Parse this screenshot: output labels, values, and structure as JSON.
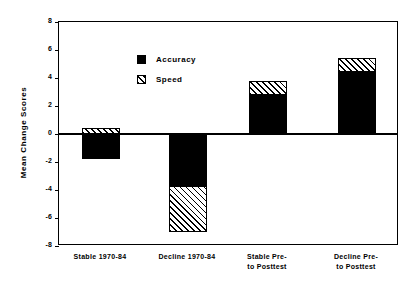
{
  "chart_data": {
    "type": "bar",
    "title": "",
    "subtitle": "",
    "xlabel": "",
    "ylabel": "Mean Change Scores",
    "ylim": [
      -8,
      8
    ],
    "yticks": [
      "8",
      "6",
      "4",
      "2",
      "0",
      "-2",
      "-4",
      "-6",
      "-8"
    ],
    "ytick_values": [
      8,
      6,
      4,
      2,
      0,
      -2,
      -4,
      -6,
      -8
    ],
    "grid": false,
    "stacked": true,
    "legend_position": "upper-left-inside",
    "categories": [
      "Stable  1970-84",
      "Decline  1970-84",
      "Stable  Pre-\nto Posttest",
      "Decline  Pre-\nto Posttest"
    ],
    "series": [
      {
        "name": "Accuracy",
        "values": [
          -1.8,
          -3.7,
          2.8,
          4.4
        ]
      },
      {
        "name": "Speed",
        "values": [
          0.4,
          -3.3,
          1.0,
          1.0
        ]
      }
    ],
    "segments": [
      {
        "category_index": 0,
        "accuracy_from": 0,
        "accuracy_to": -1.8,
        "speed_from": 0,
        "speed_to": 0.4
      },
      {
        "category_index": 1,
        "accuracy_from": 0,
        "accuracy_to": -3.7,
        "speed_from": -3.7,
        "speed_to": -7.0
      },
      {
        "category_index": 2,
        "accuracy_from": 0,
        "accuracy_to": 2.8,
        "speed_from": 2.8,
        "speed_to": 3.8
      },
      {
        "category_index": 3,
        "accuracy_from": 0,
        "accuracy_to": 4.4,
        "speed_from": 4.4,
        "speed_to": 5.4
      }
    ],
    "totals": [
      -1.4,
      -7.0,
      3.8,
      5.4
    ]
  },
  "axis": {
    "y_title": "Mean Change Scores",
    "ticks": [
      {
        "label": "8"
      },
      {
        "label": "6"
      },
      {
        "label": "4"
      },
      {
        "label": "2"
      },
      {
        "label": "0"
      },
      {
        "label": "-2"
      },
      {
        "label": "-4"
      },
      {
        "label": "-6"
      },
      {
        "label": "-8"
      }
    ]
  },
  "legend": {
    "items": [
      {
        "label": "Accuracy",
        "swatch": "solid-black"
      },
      {
        "label": "Speed",
        "swatch": "hatched-diagonal"
      }
    ]
  },
  "x_labels": [
    {
      "line1": "Stable  1970-84",
      "line2": ""
    },
    {
      "line1": "Decline  1970-84",
      "line2": ""
    },
    {
      "line1": "Stable  Pre-",
      "line2": "to Posttest"
    },
    {
      "line1": "Decline  Pre-",
      "line2": "to Posttest"
    }
  ],
  "colors": {
    "accuracy": "#000000",
    "speed_background": "#ffffff",
    "speed_hatch": "#000000",
    "axis": "#000000",
    "plot_background": "#ffffff"
  }
}
